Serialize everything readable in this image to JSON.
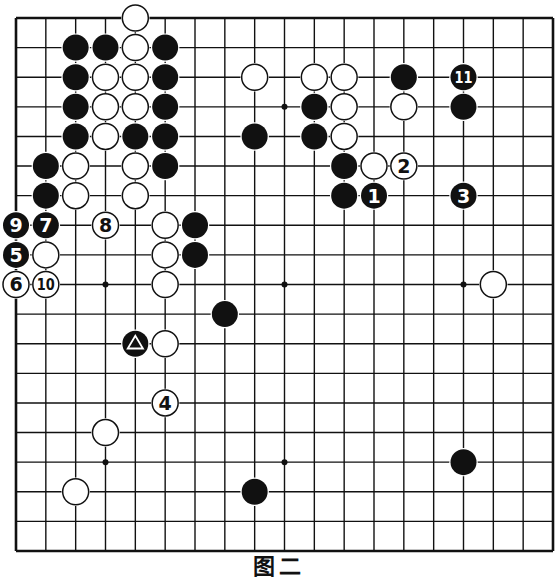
{
  "diagram": {
    "caption": "图二",
    "board_size": 19,
    "colors": {
      "background": "#ffffff",
      "line": "#111111",
      "black": "#111111",
      "white": "#ffffff"
    },
    "star_points": [
      [
        3,
        3
      ],
      [
        3,
        9
      ],
      [
        3,
        15
      ],
      [
        9,
        3
      ],
      [
        9,
        9
      ],
      [
        9,
        15
      ],
      [
        15,
        3
      ],
      [
        15,
        9
      ],
      [
        15,
        15
      ]
    ],
    "stones": [
      {
        "r": 0,
        "c": 4,
        "color": "white"
      },
      {
        "r": 1,
        "c": 2,
        "color": "black"
      },
      {
        "r": 1,
        "c": 3,
        "color": "black"
      },
      {
        "r": 1,
        "c": 4,
        "color": "white"
      },
      {
        "r": 1,
        "c": 5,
        "color": "black"
      },
      {
        "r": 2,
        "c": 2,
        "color": "black"
      },
      {
        "r": 2,
        "c": 3,
        "color": "white"
      },
      {
        "r": 2,
        "c": 4,
        "color": "white"
      },
      {
        "r": 2,
        "c": 5,
        "color": "black"
      },
      {
        "r": 2,
        "c": 8,
        "color": "white"
      },
      {
        "r": 2,
        "c": 10,
        "color": "white"
      },
      {
        "r": 2,
        "c": 11,
        "color": "white"
      },
      {
        "r": 2,
        "c": 13,
        "color": "black"
      },
      {
        "r": 2,
        "c": 15,
        "color": "black",
        "label": "11"
      },
      {
        "r": 3,
        "c": 2,
        "color": "black"
      },
      {
        "r": 3,
        "c": 3,
        "color": "white"
      },
      {
        "r": 3,
        "c": 4,
        "color": "white"
      },
      {
        "r": 3,
        "c": 5,
        "color": "black"
      },
      {
        "r": 3,
        "c": 10,
        "color": "black"
      },
      {
        "r": 3,
        "c": 11,
        "color": "white"
      },
      {
        "r": 3,
        "c": 13,
        "color": "white"
      },
      {
        "r": 3,
        "c": 15,
        "color": "black"
      },
      {
        "r": 4,
        "c": 2,
        "color": "black"
      },
      {
        "r": 4,
        "c": 3,
        "color": "white"
      },
      {
        "r": 4,
        "c": 4,
        "color": "black"
      },
      {
        "r": 4,
        "c": 5,
        "color": "black"
      },
      {
        "r": 4,
        "c": 8,
        "color": "black"
      },
      {
        "r": 4,
        "c": 10,
        "color": "black"
      },
      {
        "r": 4,
        "c": 11,
        "color": "white"
      },
      {
        "r": 5,
        "c": 1,
        "color": "black"
      },
      {
        "r": 5,
        "c": 2,
        "color": "white"
      },
      {
        "r": 5,
        "c": 4,
        "color": "white"
      },
      {
        "r": 5,
        "c": 5,
        "color": "black"
      },
      {
        "r": 5,
        "c": 11,
        "color": "black"
      },
      {
        "r": 5,
        "c": 12,
        "color": "white"
      },
      {
        "r": 5,
        "c": 13,
        "color": "white",
        "label": "2"
      },
      {
        "r": 6,
        "c": 1,
        "color": "black"
      },
      {
        "r": 6,
        "c": 2,
        "color": "white"
      },
      {
        "r": 6,
        "c": 4,
        "color": "white"
      },
      {
        "r": 6,
        "c": 11,
        "color": "black"
      },
      {
        "r": 6,
        "c": 12,
        "color": "black",
        "label": "1"
      },
      {
        "r": 6,
        "c": 15,
        "color": "black",
        "label": "3"
      },
      {
        "r": 7,
        "c": 0,
        "color": "black",
        "label": "9"
      },
      {
        "r": 7,
        "c": 1,
        "color": "black",
        "label": "7"
      },
      {
        "r": 7,
        "c": 3,
        "color": "white",
        "label": "8"
      },
      {
        "r": 7,
        "c": 5,
        "color": "white"
      },
      {
        "r": 7,
        "c": 6,
        "color": "black"
      },
      {
        "r": 8,
        "c": 0,
        "color": "black",
        "label": "5"
      },
      {
        "r": 8,
        "c": 1,
        "color": "white"
      },
      {
        "r": 8,
        "c": 5,
        "color": "white"
      },
      {
        "r": 8,
        "c": 6,
        "color": "black"
      },
      {
        "r": 9,
        "c": 0,
        "color": "white",
        "label": "6"
      },
      {
        "r": 9,
        "c": 1,
        "color": "white",
        "label": "10"
      },
      {
        "r": 9,
        "c": 5,
        "color": "white"
      },
      {
        "r": 9,
        "c": 16,
        "color": "white"
      },
      {
        "r": 10,
        "c": 7,
        "color": "black"
      },
      {
        "r": 11,
        "c": 4,
        "color": "black",
        "mark": "triangle"
      },
      {
        "r": 11,
        "c": 5,
        "color": "white"
      },
      {
        "r": 13,
        "c": 5,
        "color": "white",
        "label": "4"
      },
      {
        "r": 14,
        "c": 3,
        "color": "white"
      },
      {
        "r": 15,
        "c": 15,
        "color": "black"
      },
      {
        "r": 16,
        "c": 2,
        "color": "white"
      },
      {
        "r": 16,
        "c": 8,
        "color": "black"
      }
    ]
  }
}
